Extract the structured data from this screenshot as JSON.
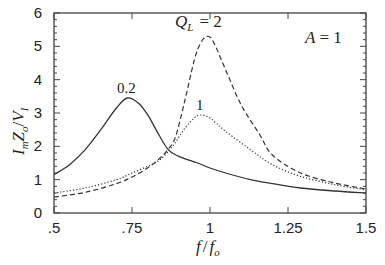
{
  "chart_data": {
    "type": "line",
    "title": "",
    "xlabel": "f/f_o",
    "ylabel": "I_m Z_o / V_I",
    "xlim": [
      0.5,
      1.5
    ],
    "ylim": [
      0,
      6
    ],
    "xticks": [
      ".5",
      ".75",
      "1",
      "1.25",
      "1.5"
    ],
    "xtick_values": [
      0.5,
      0.75,
      1.0,
      1.25,
      1.5
    ],
    "yticks": [
      "0",
      "1",
      "2",
      "3",
      "4",
      "5",
      "6"
    ],
    "ytick_values": [
      0,
      1,
      2,
      3,
      4,
      5,
      6
    ],
    "grid": false,
    "annotations": [
      {
        "text": "A = 1",
        "position": "top-right"
      },
      {
        "text": "Q_L = 2",
        "x": 0.98,
        "y": 5.7
      },
      {
        "text": "0.2",
        "x": 0.735,
        "y": 3.65
      },
      {
        "text": "1",
        "x": 0.97,
        "y": 3.1
      }
    ],
    "series": [
      {
        "name": "Q_L = 0.2",
        "style": "solid",
        "x": [
          0.5,
          0.55,
          0.6,
          0.65,
          0.7,
          0.735,
          0.77,
          0.8,
          0.83,
          0.866,
          0.9,
          0.96,
          1.0,
          1.05,
          1.13,
          1.2,
          1.29,
          1.4,
          1.5
        ],
        "y": [
          1.15,
          1.45,
          1.9,
          2.5,
          3.15,
          3.45,
          3.3,
          2.95,
          2.45,
          1.9,
          1.7,
          1.5,
          1.35,
          1.2,
          1.0,
          0.88,
          0.75,
          0.66,
          0.6
        ]
      },
      {
        "name": "Q_L = 1",
        "style": "dotted",
        "x": [
          0.5,
          0.6,
          0.7,
          0.75,
          0.8,
          0.84,
          0.88,
          0.92,
          0.95,
          0.97,
          1.0,
          1.05,
          1.13,
          1.2,
          1.29,
          1.4,
          1.5
        ],
        "y": [
          0.6,
          0.75,
          1.0,
          1.2,
          1.4,
          1.6,
          2.0,
          2.55,
          2.85,
          2.94,
          2.85,
          2.45,
          1.9,
          1.45,
          1.1,
          0.85,
          0.69
        ]
      },
      {
        "name": "Q_L = 2",
        "style": "dashed",
        "x": [
          0.5,
          0.6,
          0.7,
          0.75,
          0.8,
          0.84,
          0.865,
          0.89,
          0.92,
          0.95,
          0.97,
          0.99,
          1.01,
          1.05,
          1.1,
          1.16,
          1.2,
          1.29,
          1.4,
          1.5
        ],
        "y": [
          0.48,
          0.62,
          0.88,
          1.08,
          1.35,
          1.65,
          1.9,
          2.3,
          3.4,
          4.6,
          5.1,
          5.3,
          5.15,
          4.3,
          3.24,
          2.34,
          1.74,
          1.2,
          0.9,
          0.72
        ]
      }
    ]
  }
}
